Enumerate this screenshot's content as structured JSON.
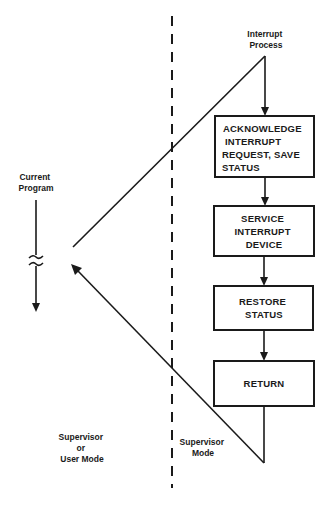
{
  "diagram": {
    "interrupt_label": [
      "Interrupt",
      "Process"
    ],
    "current_program_label": [
      "Current",
      "Program"
    ],
    "left_mode_label": [
      "Supervisor",
      "or",
      "User Mode"
    ],
    "right_mode_label": [
      "Supervisor",
      "Mode"
    ],
    "steps": [
      {
        "lines": [
          "ACKNOWLEDGE",
          "INTERRUPT",
          "REQUEST, SAVE",
          "STATUS"
        ]
      },
      {
        "lines": [
          "SERVICE",
          "INTERRUPT",
          "DEVICE"
        ]
      },
      {
        "lines": [
          "RESTORE",
          "STATUS"
        ]
      },
      {
        "lines": [
          "RETURN"
        ]
      }
    ],
    "colors": {
      "ink": "#1a1a1a",
      "background": "#ffffff"
    }
  }
}
